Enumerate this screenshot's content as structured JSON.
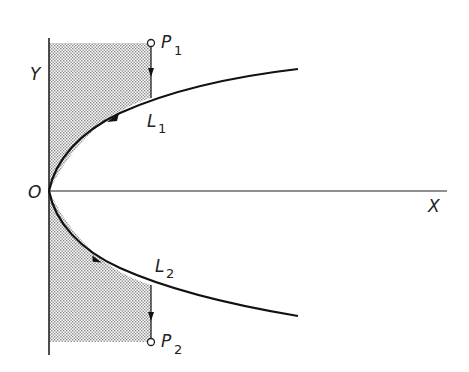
{
  "diagram": {
    "axes": {
      "x_label": "X",
      "y_label": "Y",
      "origin_label": "O"
    },
    "curves": [
      {
        "id": "L1",
        "label": "L",
        "subscript": "1",
        "direction": "toward origin"
      },
      {
        "id": "L2",
        "label": "L",
        "subscript": "2",
        "direction": "away from origin"
      }
    ],
    "points": [
      {
        "id": "P1",
        "label": "P",
        "subscript": "1"
      },
      {
        "id": "P2",
        "label": "P",
        "subscript": "2"
      }
    ],
    "shaded_region": "area between Y axis, curve, and vertical lines through P1 and P2",
    "colors": {
      "ink": "#222222",
      "shade": "#c8c8c8",
      "background": "#ffffff"
    }
  }
}
